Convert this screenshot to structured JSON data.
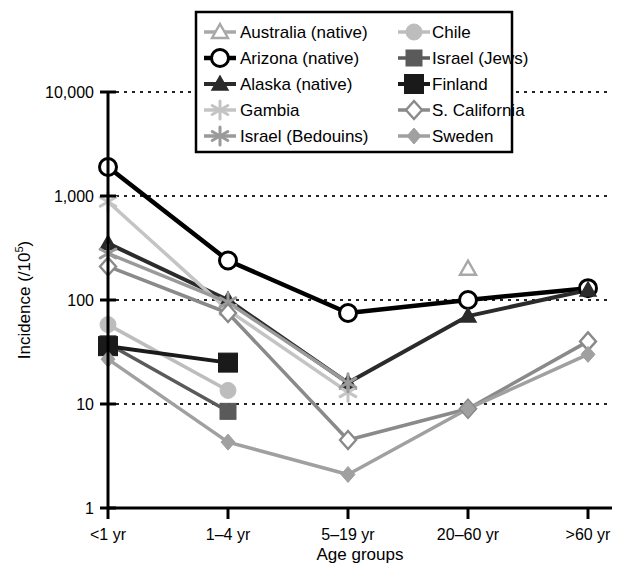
{
  "chart_data": {
    "type": "line",
    "title": "",
    "xlabel": "Age groups",
    "ylabel": "Incidence (/10^5)",
    "ylabel_base": "Incidence (/10",
    "ylabel_exp": "5",
    "ylabel_tail": ")",
    "scale": "log",
    "grid": true,
    "grid_style": "dotted horizontal",
    "legend_position": "top-center, two columns, boxed",
    "categories": [
      "<1 yr",
      "1–4 yr",
      "5–19 yr",
      "20–60 yr",
      ">60 yr"
    ],
    "yticks": [
      1,
      10,
      100,
      1000,
      10000
    ],
    "ytick_labels": [
      "1",
      "10",
      "100",
      "1,000",
      "10,000"
    ],
    "ylim": [
      1,
      10000
    ],
    "series": [
      {
        "name": "Australia (native)",
        "marker": "triangle-up-open",
        "color": "#a8a8a8",
        "values": [
          null,
          null,
          null,
          200,
          null
        ]
      },
      {
        "name": "Arizona (native)",
        "marker": "circle-open",
        "color": "#000000",
        "values": [
          1900,
          240,
          75,
          100,
          130
        ]
      },
      {
        "name": "Alaska (native)",
        "marker": "triangle-up-filled",
        "color": "#2b2b2b",
        "values": [
          350,
          100,
          16,
          70,
          125
        ]
      },
      {
        "name": "Gambia",
        "marker": "asterisk-light",
        "color": "#c4c4c4",
        "values": [
          880,
          80,
          13,
          null,
          null
        ]
      },
      {
        "name": "Israel (Bedouins)",
        "marker": "asterisk-gray",
        "color": "#9a9a9a",
        "values": [
          280,
          95,
          16,
          null,
          null
        ]
      },
      {
        "name": "Chile",
        "marker": "circle-filled",
        "color": "#bdbdbd",
        "values": [
          58,
          13.5,
          null,
          null,
          null
        ]
      },
      {
        "name": "Israel (Jews)",
        "marker": "square-filled-dark",
        "color": "#5a5a5a",
        "values": [
          38,
          8.5,
          null,
          null,
          null
        ]
      },
      {
        "name": "Finland",
        "marker": "square-filled-black",
        "color": "#1a1a1a",
        "values": [
          36,
          25,
          null,
          null,
          null
        ]
      },
      {
        "name": "S. California",
        "marker": "diamond-open",
        "color": "#8a8a8a",
        "values": [
          210,
          75,
          4.5,
          9,
          40
        ]
      },
      {
        "name": "Sweden",
        "marker": "diamond-filled",
        "color": "#a0a0a0",
        "values": [
          27,
          4.3,
          2.1,
          9,
          30
        ]
      }
    ]
  },
  "legend": {
    "columns": [
      [
        "Australia (native)",
        "Arizona (native)",
        "Alaska (native)",
        "Gambia",
        "Israel (Bedouins)"
      ],
      [
        "Chile",
        "Israel (Jews)",
        "Finland",
        "S. California",
        "Sweden"
      ]
    ]
  },
  "colors": {
    "background": "#ffffff",
    "axis": "#000000",
    "grid": "#222222",
    "black": "#000000"
  }
}
